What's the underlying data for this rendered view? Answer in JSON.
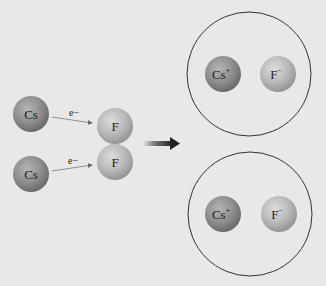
{
  "diagram": {
    "reactants": {
      "cs_atoms": [
        {
          "label": "Cs",
          "cx": 31,
          "cy": 114
        },
        {
          "label": "Cs",
          "cx": 31,
          "cy": 174
        }
      ],
      "f_atoms": [
        {
          "label": "F",
          "cx": 115,
          "cy": 126
        },
        {
          "label": "F",
          "cx": 115,
          "cy": 162
        }
      ],
      "electron_label": "e−"
    },
    "products": [
      {
        "cation": "Cs",
        "cation_charge": "+",
        "anion": "F",
        "anion_charge": "−"
      },
      {
        "cation": "Cs",
        "cation_charge": "+",
        "anion": "F",
        "anion_charge": "−"
      }
    ],
    "colors": {
      "background": "#e8e8e8",
      "cs_atom": "#8f8f8f",
      "f_atom": "#b8b8b8",
      "arrow": "#333333",
      "circle_outline": "#333333"
    }
  }
}
